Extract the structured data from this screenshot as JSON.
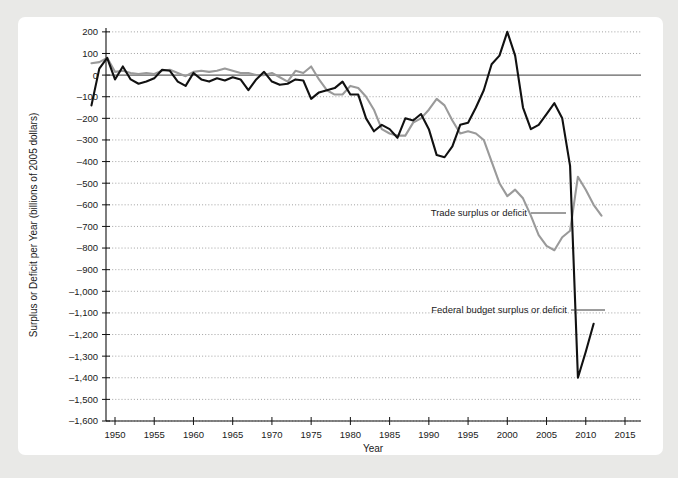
{
  "figure": {
    "panel_background": "#ffffff",
    "page_background": "#e9e9e7"
  },
  "chart_data": {
    "type": "line",
    "title": "",
    "xlabel": "Year",
    "ylabel": "Surplus or Deficit per Year (billions of 2005 dollars)",
    "xlim": [
      1946,
      2017
    ],
    "ylim": [
      -1600,
      250
    ],
    "xticks": [
      1950,
      1955,
      1960,
      1965,
      1970,
      1975,
      1980,
      1985,
      1990,
      1995,
      2000,
      2005,
      2010,
      2015
    ],
    "xtick_labels": [
      "1950",
      "1955",
      "1960",
      "1965",
      "1970",
      "1975",
      "1980",
      "1985",
      "1990",
      "1995",
      "2000",
      "2005",
      "2010",
      "2015"
    ],
    "yticks": [
      200,
      100,
      0,
      -100,
      -200,
      -300,
      -400,
      -500,
      -600,
      -700,
      -800,
      -900,
      -1000,
      -1100,
      -1200,
      -1300,
      -1400,
      -1500,
      -1600
    ],
    "ytick_labels": [
      "200",
      "100",
      "0",
      "–100",
      "–200",
      "–300",
      "–400",
      "–500",
      "–600",
      "–700",
      "–800",
      "–900",
      "–1,000",
      "–1,100",
      "–1,200",
      "–1,300",
      "–1,400",
      "–1,500",
      "–1,600"
    ],
    "grid": true,
    "grid_style": "dotted-horizontal",
    "legend_position": "inline-annotations",
    "series": [
      {
        "name": "Federal budget surplus or deficit",
        "color": "#111111",
        "x": [
          1947,
          1948,
          1949,
          1950,
          1951,
          1952,
          1953,
          1954,
          1955,
          1956,
          1957,
          1958,
          1959,
          1960,
          1961,
          1962,
          1963,
          1964,
          1965,
          1966,
          1967,
          1968,
          1969,
          1970,
          1971,
          1972,
          1973,
          1974,
          1975,
          1976,
          1977,
          1978,
          1979,
          1980,
          1981,
          1982,
          1983,
          1984,
          1985,
          1986,
          1987,
          1988,
          1989,
          1990,
          1991,
          1992,
          1993,
          1994,
          1995,
          1996,
          1997,
          1998,
          1999,
          2000,
          2001,
          2002,
          2003,
          2004,
          2005,
          2006,
          2007,
          2008,
          2009,
          2010,
          2011
        ],
        "values": [
          -140,
          30,
          80,
          -20,
          40,
          -20,
          -40,
          -30,
          -15,
          25,
          20,
          -30,
          -50,
          10,
          -20,
          -30,
          -15,
          -25,
          -10,
          -20,
          -70,
          -20,
          15,
          -30,
          -45,
          -40,
          -20,
          -25,
          -110,
          -80,
          -70,
          -60,
          -30,
          -90,
          -90,
          -200,
          -260,
          -230,
          -250,
          -290,
          -200,
          -210,
          -180,
          -250,
          -370,
          -380,
          -330,
          -230,
          -220,
          -150,
          -70,
          50,
          90,
          200,
          90,
          -150,
          -250,
          -230,
          -180,
          -130,
          -200,
          -420,
          -1400,
          -1280,
          -1150
        ]
      },
      {
        "name": "Trade surplus or deficit",
        "color": "#9a9a9a",
        "x": [
          1947,
          1948,
          1949,
          1950,
          1951,
          1952,
          1953,
          1954,
          1955,
          1956,
          1957,
          1958,
          1959,
          1960,
          1961,
          1962,
          1963,
          1964,
          1965,
          1966,
          1967,
          1968,
          1969,
          1970,
          1971,
          1972,
          1973,
          1974,
          1975,
          1976,
          1977,
          1978,
          1979,
          1980,
          1981,
          1982,
          1983,
          1984,
          1985,
          1986,
          1987,
          1988,
          1989,
          1990,
          1991,
          1992,
          1993,
          1994,
          1995,
          1996,
          1997,
          1998,
          1999,
          2000,
          2001,
          2002,
          2003,
          2004,
          2005,
          2006,
          2007,
          2008,
          2009,
          2010,
          2011,
          2012
        ],
        "values": [
          55,
          60,
          80,
          15,
          20,
          10,
          5,
          10,
          5,
          20,
          25,
          10,
          -5,
          15,
          20,
          15,
          20,
          30,
          20,
          10,
          10,
          0,
          0,
          10,
          -10,
          -30,
          20,
          10,
          40,
          -20,
          -70,
          -90,
          -90,
          -50,
          -60,
          -100,
          -160,
          -250,
          -270,
          -280,
          -280,
          -220,
          -200,
          -160,
          -110,
          -140,
          -210,
          -270,
          -260,
          -270,
          -300,
          -400,
          -500,
          -560,
          -530,
          -570,
          -650,
          -740,
          -790,
          -810,
          -750,
          -720,
          -470,
          -530,
          -600,
          -650
        ]
      }
    ],
    "annotations": [
      {
        "id": "trade-annotation",
        "text": "Trade surplus or deficit",
        "label_x": 527,
        "label_y": 216,
        "leader_from_x": 531,
        "leader_from_y": 213,
        "leader_to_x": 566,
        "leader_to_y": 213
      },
      {
        "id": "federal-annotation",
        "text": "Federal budget surplus or deficit",
        "label_x": 567,
        "label_y": 313,
        "leader_from_x": 571,
        "leader_from_y": 310,
        "leader_to_x": 605,
        "leader_to_y": 310
      }
    ]
  }
}
